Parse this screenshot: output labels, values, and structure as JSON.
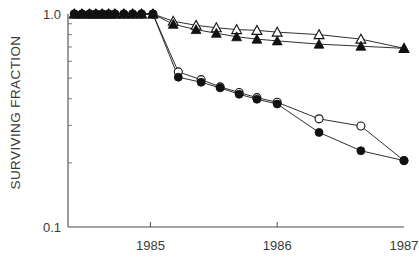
{
  "chart_data": {
    "type": "line",
    "title": "",
    "xlabel": "",
    "ylabel": "SURVIVING FRACTION",
    "yscale": "log",
    "ylim": [
      0.1,
      1.0
    ],
    "ytick_labels": [
      "1.0",
      "0.1"
    ],
    "ytick_values": [
      1.0,
      0.1
    ],
    "xlim": [
      1984.35,
      1987.0
    ],
    "xtick_labels": [
      "1985",
      "1986",
      "1987"
    ],
    "xtick_values": [
      1985,
      1986,
      1987
    ],
    "grid": false,
    "legend": "none",
    "series": [
      {
        "name": "open-triangle",
        "marker": "open-triangle",
        "x": [
          1984.4,
          1984.46,
          1984.52,
          1984.57,
          1984.62,
          1984.67,
          1984.72,
          1984.79,
          1984.86,
          1984.93,
          1985.02,
          1985.18,
          1985.36,
          1985.52,
          1985.68,
          1985.84,
          1986.0,
          1986.33,
          1986.66,
          1987.0
        ],
        "y": [
          1.0,
          1.0,
          1.0,
          1.0,
          1.0,
          1.0,
          1.0,
          1.0,
          1.0,
          1.0,
          1.0,
          0.925,
          0.885,
          0.862,
          0.845,
          0.838,
          0.822,
          0.8,
          0.762,
          0.69
        ]
      },
      {
        "name": "filled-triangle",
        "marker": "filled-triangle",
        "x": [
          1984.4,
          1984.46,
          1984.52,
          1984.57,
          1984.62,
          1984.67,
          1984.72,
          1984.79,
          1984.86,
          1984.93,
          1985.02,
          1985.18,
          1985.36,
          1985.52,
          1985.68,
          1985.84,
          1986.0,
          1986.33,
          1986.66,
          1987.0
        ],
        "y": [
          1.0,
          1.0,
          1.0,
          1.0,
          1.0,
          1.0,
          1.0,
          1.0,
          1.0,
          1.0,
          1.0,
          0.895,
          0.845,
          0.812,
          0.782,
          0.762,
          0.748,
          0.722,
          0.706,
          0.69
        ]
      },
      {
        "name": "open-circle",
        "marker": "open-circle",
        "x": [
          1984.4,
          1984.46,
          1984.52,
          1984.57,
          1984.62,
          1984.67,
          1984.72,
          1984.79,
          1984.86,
          1984.93,
          1985.02,
          1985.22,
          1985.4,
          1985.55,
          1985.7,
          1985.84,
          1986.0,
          1986.33,
          1986.66,
          1987.0
        ],
        "y": [
          1.0,
          1.0,
          1.0,
          1.0,
          1.0,
          1.0,
          1.0,
          1.0,
          1.0,
          1.0,
          1.0,
          0.535,
          0.492,
          0.455,
          0.428,
          0.405,
          0.385,
          0.322,
          0.298,
          0.205
        ]
      },
      {
        "name": "filled-circle",
        "marker": "filled-circle",
        "x": [
          1984.4,
          1984.46,
          1984.52,
          1984.57,
          1984.62,
          1984.67,
          1984.72,
          1984.79,
          1984.86,
          1984.93,
          1985.02,
          1985.22,
          1985.4,
          1985.55,
          1985.7,
          1985.84,
          1986.0,
          1986.33,
          1986.66,
          1987.0
        ],
        "y": [
          1.0,
          1.0,
          1.0,
          1.0,
          1.0,
          1.0,
          1.0,
          1.0,
          1.0,
          1.0,
          1.0,
          0.505,
          0.478,
          0.45,
          0.42,
          0.398,
          0.378,
          0.278,
          0.228,
          0.205
        ]
      }
    ]
  },
  "colors": {
    "axis": "#4a4a4a",
    "marker": "#111111",
    "line": "#1a1a1a",
    "text": "#3a3a3a",
    "background": "#ffffff"
  }
}
